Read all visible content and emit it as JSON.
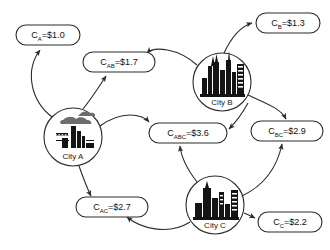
{
  "diagram": {
    "type": "node-link-graph",
    "background_color": "#ffffff",
    "stroke_color": "#2b2b2b",
    "nodes": [
      {
        "id": "city_a",
        "label": "City A",
        "icon": "factory-icon",
        "cx": 73,
        "cy": 137,
        "r": 29
      },
      {
        "id": "city_b",
        "label": "City B",
        "icon": "city-skyline-icon",
        "cx": 222,
        "cy": 82,
        "r": 29
      },
      {
        "id": "city_c",
        "label": "City C",
        "icon": "city-skyline-icon",
        "cx": 215,
        "cy": 205,
        "r": 29
      }
    ],
    "cost_labels": [
      {
        "id": "c_a",
        "base": "C",
        "sub": "A",
        "value": "=$1.0",
        "text": "C_A=$1.0",
        "cx": 48,
        "cy": 35,
        "w": 64,
        "h": 20
      },
      {
        "id": "c_ab",
        "base": "C",
        "sub": "AB",
        "value": "=$1.7",
        "text": "C_AB=$1.7",
        "cx": 119,
        "cy": 62,
        "w": 72,
        "h": 20
      },
      {
        "id": "c_b",
        "base": "C",
        "sub": "B",
        "value": "=$1.3",
        "text": "C_B=$1.3",
        "cx": 288,
        "cy": 23,
        "w": 64,
        "h": 20
      },
      {
        "id": "c_abc",
        "base": "C",
        "sub": "ABC",
        "value": "=$3.6",
        "text": "C_ABC=$3.6",
        "cx": 188,
        "cy": 133,
        "w": 78,
        "h": 20
      },
      {
        "id": "c_bc",
        "base": "C",
        "sub": "BC",
        "value": "=$2.9",
        "text": "C_BC=$2.9",
        "cx": 287,
        "cy": 131,
        "w": 72,
        "h": 20
      },
      {
        "id": "c_ac",
        "base": "C",
        "sub": "AC",
        "value": "=$2.7",
        "text": "C_AC=$2.7",
        "cx": 112,
        "cy": 207,
        "w": 72,
        "h": 20
      },
      {
        "id": "c_c",
        "base": "C",
        "sub": "C",
        "value": "=$2.2",
        "text": "C_C=$2.2",
        "cx": 290,
        "cy": 222,
        "w": 64,
        "h": 20
      }
    ],
    "edges": [
      {
        "id": "edge-city-a-to-c-a",
        "from": "city_a",
        "to": "c_a",
        "path": "M 52,117 C 30,100 25,70 40,50"
      },
      {
        "id": "edge-city-a-to-c-ab",
        "from": "city_a",
        "to": "c_ab",
        "path": "M 83,109 C 94,95 100,85 106,76"
      },
      {
        "id": "edge-city-b-to-c-ab",
        "from": "city_b",
        "to": "c_ab",
        "path": "M 197,65 C 178,50 152,48 146,53"
      },
      {
        "id": "edge-city-b-to-c-b",
        "from": "city_b",
        "to": "c_b",
        "path": "M 224,53 C 232,36 242,26 253,23"
      },
      {
        "id": "edge-city-b-to-c-bc",
        "from": "city_b",
        "to": "c_bc",
        "path": "M 248,95 C 268,104 280,110 286,119"
      },
      {
        "id": "edge-city-b-to-c-abc",
        "from": "city_b",
        "to": "c_abc",
        "path": "M 246,101 C 240,112 232,122 227,128"
      },
      {
        "id": "edge-city-a-to-c-abc",
        "from": "city_a",
        "to": "c_abc",
        "path": "M 100,126 C 122,112 140,116 148,127"
      },
      {
        "id": "edge-city-a-to-c-ac",
        "from": "city_a",
        "to": "c_ac",
        "path": "M 79,166 C 84,180 88,190 92,197"
      },
      {
        "id": "edge-city-c-to-c-abc",
        "from": "city_c",
        "to": "c_abc",
        "path": "M 196,182 C 186,168 180,155 180,145"
      },
      {
        "id": "edge-city-c-to-c-bc",
        "from": "city_c",
        "to": "c_bc",
        "path": "M 242,196 C 262,186 276,168 282,143"
      },
      {
        "id": "edge-city-c-to-c-c",
        "from": "city_c",
        "to": "c_c",
        "path": "M 244,211 C 250,214 254,216 256,218"
      },
      {
        "id": "edge-city-c-to-c-ac",
        "from": "city_c",
        "to": "c_ac",
        "path": "M 190,220 C 170,233 140,226 127,216"
      }
    ]
  }
}
